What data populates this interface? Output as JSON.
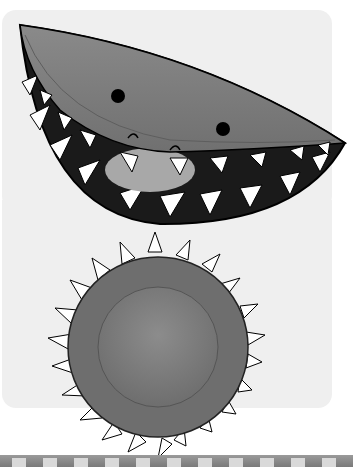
{
  "illustration": {
    "subject": "paper plate shark craft",
    "parts": [
      "shark-jaw-half-plate",
      "toothed-circle-plate"
    ],
    "colors": {
      "body": "#7c7c7c",
      "rim": "#6a6a6a",
      "tooth": "#ffffff",
      "outline": "#111111",
      "background": "#efefef",
      "tongue": "#a8a8a8"
    }
  }
}
